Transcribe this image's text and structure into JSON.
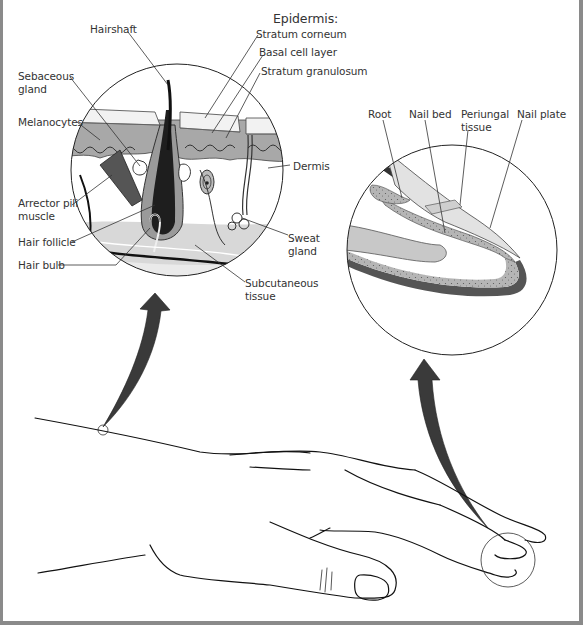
{
  "skin": {
    "heading": "Epidermis:",
    "labels": {
      "hairshaft": "Hairshaft",
      "stratum_corneum": "Stratum corneum",
      "basal_cell_layer": "Basal cell layer",
      "stratum_granulosum": "Stratum granulosum",
      "sebaceous_gland": "Sebaceous\ngland",
      "melanocytes": "Melanocytes",
      "dermis": "Dermis",
      "arrector_pili": "Arrector pili\nmuscle",
      "hair_follicle": "Hair follicle",
      "hair_bulb": "Hair bulb",
      "sweat_gland": "Sweat\ngland",
      "subcutaneous": "Subcutaneous\ntissue"
    }
  },
  "nail": {
    "labels": {
      "root": "Root",
      "nail_bed": "Nail bed",
      "periungal": "Periungal\ntissue",
      "nail_plate": "Nail plate"
    }
  },
  "colors": {
    "ink": "#1a1a1a",
    "dark_gray": "#3a3a3a",
    "mid_gray": "#9a9a9a",
    "light_gray": "#d4d4d4",
    "border": "#8a8a8a"
  }
}
